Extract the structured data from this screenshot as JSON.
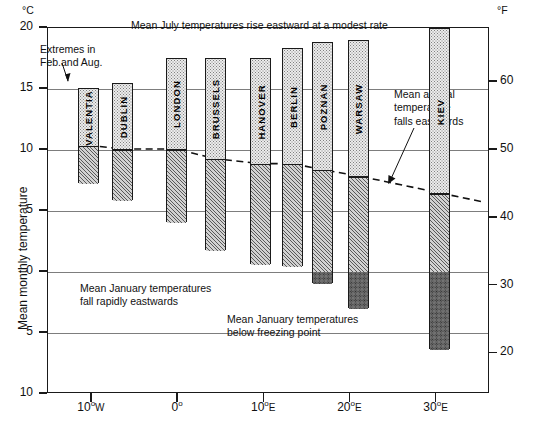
{
  "chart_data": {
    "type": "bar",
    "title": "Mean July temperatures rise eastward at a modest rate",
    "xlabel": "",
    "ylabel": "Mean monthly temperature",
    "unit_left": "°C",
    "unit_right": "°F",
    "ylim": [
      -10,
      20
    ],
    "ylim_f": [
      14,
      68
    ],
    "grid": true,
    "legend": "none",
    "y_ticks_c": [
      20,
      15,
      10,
      5,
      0,
      -5,
      -10
    ],
    "y_tick_labels_c": [
      "20",
      "15",
      "10",
      "5",
      "0",
      "5",
      "10"
    ],
    "y_ticks_f": [
      60,
      50,
      40,
      30,
      20
    ],
    "y_tick_labels_f": [
      "60",
      "50",
      "40",
      "30",
      "20"
    ],
    "x_ticks": [
      -10,
      0,
      10,
      20,
      30
    ],
    "x_tick_labels": [
      "10°W",
      "0°",
      "10°E",
      "20°E",
      "30°E"
    ],
    "xlim": [
      -15.1,
      36.2
    ],
    "categories": [
      "VALENTIA",
      "DUBLIN",
      "LONDON",
      "BRUSSELS",
      "HANOVER",
      "BERLIN",
      "POZNAN",
      "WARSAW",
      "KIEV"
    ],
    "series": [
      {
        "name": "Mean July temperature (top of bar)",
        "values": [
          15.0,
          15.4,
          17.5,
          17.5,
          17.5,
          18.3,
          18.8,
          18.9,
          19.9
        ]
      },
      {
        "name": "Mean annual temperature (bar division)",
        "values": [
          10.3,
          10.0,
          10.0,
          9.2,
          8.8,
          8.8,
          8.3,
          7.8,
          6.4
        ]
      },
      {
        "name": "Mean January temperature (bottom of bar)",
        "values": [
          7.2,
          5.8,
          4.0,
          1.7,
          0.6,
          0.4,
          -1.0,
          -3.0,
          -6.4
        ]
      }
    ],
    "longitudes": [
      -10.3,
      -6.3,
      -0.1,
      4.4,
      9.7,
      13.4,
      16.9,
      21.0,
      30.5
    ],
    "annotations": [
      "Extremes in\nFeb.and Aug.",
      "Mean annual\ntemperature\nfalls eastwards",
      "Mean January temperatures\nfall rapidly eastwards",
      "Mean January temperatures\nbelow freezing point"
    ]
  },
  "labels": {
    "title": "Mean July temperatures rise eastward at a modest rate",
    "unit_left": "°C",
    "unit_right": "°F",
    "y_axis_title": "Mean monthly temperature",
    "anno_extremes": "Extremes in\nFeb.and Aug.",
    "anno_annual": "Mean annual\ntemperature\nfalls eastwards",
    "anno_jan_fall": "Mean January temperatures\nfall rapidly eastwards",
    "anno_jan_freeze": "Mean January temperatures\nbelow freezing point"
  },
  "y_axis_c": {
    "ticks": [
      {
        "label": "20",
        "value": 20
      },
      {
        "label": "15",
        "value": 15
      },
      {
        "label": "10",
        "value": 10
      },
      {
        "label": "5",
        "value": 5
      },
      {
        "label": "0",
        "value": 0
      },
      {
        "label": "5",
        "value": -5
      },
      {
        "label": "10",
        "value": -10
      }
    ]
  },
  "y_axis_f": {
    "ticks": [
      {
        "label": "60",
        "value": 60
      },
      {
        "label": "50",
        "value": 50
      },
      {
        "label": "40",
        "value": 40
      },
      {
        "label": "30",
        "value": 30
      },
      {
        "label": "20",
        "value": 20
      }
    ]
  },
  "x_axis": {
    "ticks": [
      {
        "label": "10",
        "hemi": "W",
        "deg": true,
        "value": -10
      },
      {
        "label": "0",
        "hemi": "",
        "deg": true,
        "value": 0
      },
      {
        "label": "10",
        "hemi": "E",
        "deg": true,
        "value": 10
      },
      {
        "label": "20",
        "hemi": "E",
        "deg": true,
        "value": 20
      },
      {
        "label": "30",
        "hemi": "E",
        "deg": true,
        "value": 30
      }
    ]
  },
  "bars": [
    {
      "name": "VALENTIA",
      "july": 15.0,
      "annual": 10.3,
      "january": 7.2,
      "lon": -10.3
    },
    {
      "name": "DUBLIN",
      "july": 15.4,
      "annual": 10.0,
      "january": 5.8,
      "lon": -6.3
    },
    {
      "name": "LONDON",
      "july": 17.5,
      "annual": 10.0,
      "january": 4.0,
      "lon": -0.1
    },
    {
      "name": "BRUSSELS",
      "july": 17.5,
      "annual": 9.2,
      "january": 1.7,
      "lon": 4.4
    },
    {
      "name": "HANOVER",
      "july": 17.5,
      "annual": 8.8,
      "january": 0.6,
      "lon": 9.7
    },
    {
      "name": "BERLIN",
      "july": 18.3,
      "annual": 8.8,
      "january": 0.4,
      "lon": 13.4
    },
    {
      "name": "POZNAN",
      "july": 18.8,
      "annual": 8.3,
      "january": -1.0,
      "lon": 16.9
    },
    {
      "name": "WARSAW",
      "july": 18.9,
      "annual": 7.8,
      "january": -3.0,
      "lon": 21.0
    },
    {
      "name": "KIEV",
      "july": 19.9,
      "annual": 6.4,
      "january": -6.4,
      "lon": 30.5
    }
  ],
  "colors": {
    "axis": "#1a1a1a",
    "grid": "#7d7d7d",
    "july_fill": "#ececec",
    "january_fill": "#d2d2d2",
    "freezing_fill": "#9a9a9a",
    "text": "#111111"
  }
}
